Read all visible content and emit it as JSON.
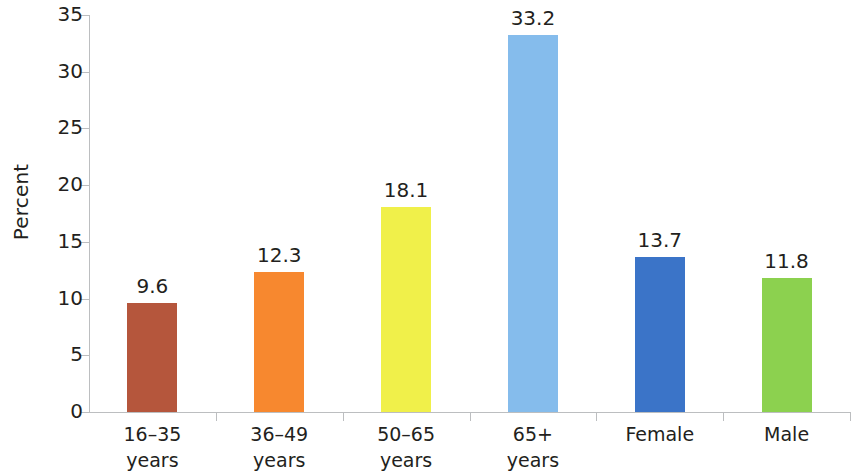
{
  "chart_data": {
    "type": "bar",
    "title": "",
    "xlabel": "",
    "ylabel": "Percent",
    "ylim": [
      0,
      35
    ],
    "ytick_values": [
      0,
      5,
      10,
      15,
      20,
      25,
      30,
      35
    ],
    "ytick_labels": [
      "0",
      "5",
      "10",
      "15",
      "20",
      "25",
      "30",
      "35"
    ],
    "grid": false,
    "legend": "none",
    "categories": [
      "16–35 years",
      "36–49 years",
      "50–65 years",
      "65+ years",
      "Female",
      "Male"
    ],
    "category_lines": [
      [
        "16–35",
        "years"
      ],
      [
        "36–49",
        "years"
      ],
      [
        "50–65",
        "years"
      ],
      [
        "65+",
        "years"
      ],
      [
        "Female",
        ""
      ],
      [
        "Male",
        ""
      ]
    ],
    "values": [
      9.6,
      12.3,
      18.1,
      33.2,
      13.7,
      11.8
    ],
    "value_labels": [
      "9.6",
      "12.3",
      "18.1",
      "33.2",
      "13.7",
      "11.8"
    ],
    "colors": [
      "#b5563c",
      "#f7882f",
      "#f0f04a",
      "#85bcec",
      "#3b74c8",
      "#8cd14f"
    ],
    "axis_color": "#bcbec0",
    "text_color": "#231f20",
    "background": "#ffffff"
  }
}
